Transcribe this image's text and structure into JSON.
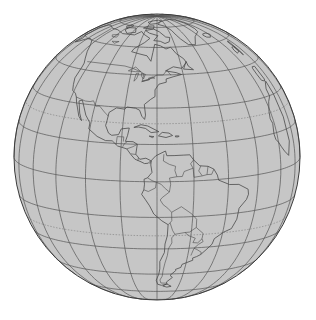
{
  "map": {
    "projection": "orthographic",
    "center": {
      "lon": -75,
      "lat": 10
    },
    "globe": {
      "cx": 157,
      "cy": 157,
      "r": 143
    },
    "colors": {
      "background": "#ffffff",
      "ocean_land_fill": "#c6c6c6",
      "coastline": "#4a4a4a",
      "graticule": "#555555",
      "tropic_dotted": "#7a7a7a",
      "limb": "#3c3c3c"
    },
    "graticule_step_deg": 15,
    "regions_visible": [
      "North America",
      "Central America",
      "Caribbean",
      "South America",
      "Greenland",
      "West Africa edge"
    ]
  }
}
